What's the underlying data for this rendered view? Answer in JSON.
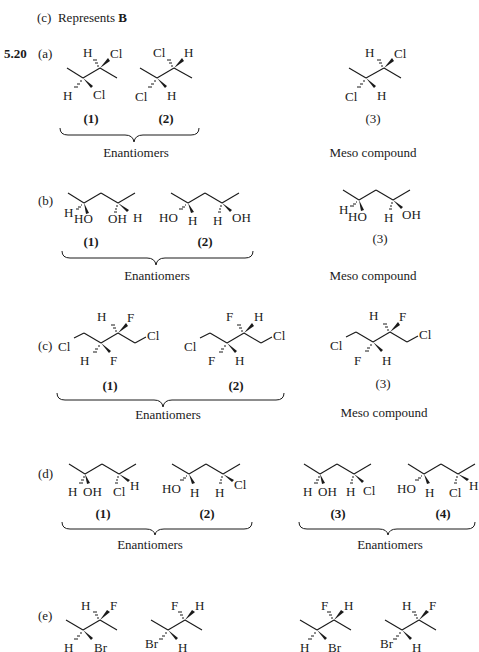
{
  "top_fragment": {
    "prefix": "(c)",
    "text": "Represents ",
    "bold": "B"
  },
  "problem": {
    "number": "5.20"
  },
  "parts": [
    {
      "label": "(a)",
      "compounds": [
        {
          "id": "(1)",
          "substituents": [
            "H",
            "Cl",
            "H",
            "Cl"
          ]
        },
        {
          "id": "(2)",
          "substituents": [
            "Cl",
            "H",
            "Cl",
            "H"
          ]
        },
        {
          "id": "(3)",
          "substituents": [
            "H",
            "Cl",
            "Cl",
            "H"
          ]
        }
      ],
      "groups": [
        {
          "members": [
            "(1)",
            "(2)"
          ],
          "caption": "Enantiomers"
        },
        {
          "members": [
            "(3)"
          ],
          "caption": "Meso compound"
        }
      ]
    },
    {
      "label": "(b)",
      "compounds": [
        {
          "id": "(1)",
          "substituents": [
            "H",
            "HO",
            "OH",
            "H"
          ]
        },
        {
          "id": "(2)",
          "substituents": [
            "HO",
            "H",
            "H",
            "OH"
          ]
        },
        {
          "id": "(3)",
          "substituents": [
            "H",
            "HO",
            "H",
            "OH"
          ]
        }
      ],
      "groups": [
        {
          "members": [
            "(1)",
            "(2)"
          ],
          "caption": "Enantiomers"
        },
        {
          "members": [
            "(3)"
          ],
          "caption": "Meso compound"
        }
      ]
    },
    {
      "label": "(c)",
      "compounds": [
        {
          "id": "(1)",
          "substituents": [
            "Cl",
            "H",
            "F",
            "H",
            "F",
            "Cl"
          ]
        },
        {
          "id": "(2)",
          "substituents": [
            "Cl",
            "F",
            "H",
            "F",
            "H",
            "Cl"
          ]
        },
        {
          "id": "(3)",
          "substituents": [
            "Cl",
            "H",
            "F",
            "F",
            "H",
            "Cl"
          ]
        }
      ],
      "groups": [
        {
          "members": [
            "(1)",
            "(2)"
          ],
          "caption": "Enantiomers"
        },
        {
          "members": [
            "(3)"
          ],
          "caption": "Meso compound"
        }
      ]
    },
    {
      "label": "(d)",
      "compounds": [
        {
          "id": "(1)",
          "substituents": [
            "H",
            "OH",
            "Cl",
            "H"
          ]
        },
        {
          "id": "(2)",
          "substituents": [
            "HO",
            "H",
            "H",
            "Cl"
          ]
        },
        {
          "id": "(3)",
          "substituents": [
            "H",
            "OH",
            "H",
            "Cl"
          ]
        },
        {
          "id": "(4)",
          "substituents": [
            "HO",
            "H",
            "Cl",
            "H"
          ]
        }
      ],
      "groups": [
        {
          "members": [
            "(1)",
            "(2)"
          ],
          "caption": "Enantiomers"
        },
        {
          "members": [
            "(3)",
            "(4)"
          ],
          "caption": "Enantiomers"
        }
      ]
    },
    {
      "label": "(e)",
      "compounds": [
        {
          "id": "e1",
          "substituents": [
            "H",
            "F",
            "H",
            "Br"
          ]
        },
        {
          "id": "e2",
          "substituents": [
            "F",
            "H",
            "Br",
            "H"
          ]
        },
        {
          "id": "e3",
          "substituents": [
            "F",
            "H",
            "H",
            "Br"
          ]
        },
        {
          "id": "e4",
          "substituents": [
            "H",
            "F",
            "Br",
            "H"
          ]
        }
      ]
    }
  ]
}
